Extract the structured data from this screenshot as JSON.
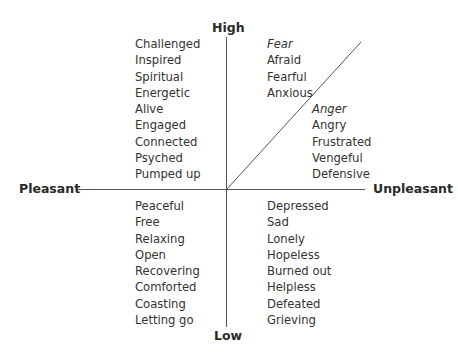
{
  "axes": {
    "top": "High",
    "bottom": "Low",
    "left": "Pleasant",
    "right": "Unpleasant"
  },
  "quadrants": {
    "high_pleasant": {
      "items": [
        "Challenged",
        "Inspired",
        "Spiritual",
        "Energetic",
        "Alive",
        "Engaged",
        "Connected",
        "Psyched",
        "Pumped up"
      ]
    },
    "high_unpleasant_fear": {
      "heading": "Fear",
      "items": [
        "Afraid",
        "Fearful",
        "Anxious"
      ]
    },
    "high_unpleasant_anger": {
      "heading": "Anger",
      "items": [
        "Angry",
        "Frustrated",
        "Vengeful",
        "Defensive"
      ]
    },
    "low_pleasant": {
      "items": [
        "Peaceful",
        "Free",
        "Relaxing",
        "Open",
        "Recovering",
        "Comforted",
        "Coasting",
        "Letting go"
      ]
    },
    "low_unpleasant": {
      "items": [
        "Depressed",
        "Sad",
        "Lonely",
        "Hopeless",
        "Burned out",
        "Helpless",
        "Defeated",
        "Grieving"
      ]
    }
  },
  "colors": {
    "line": "#555555",
    "text": "#333333",
    "background": "#ffffff"
  }
}
